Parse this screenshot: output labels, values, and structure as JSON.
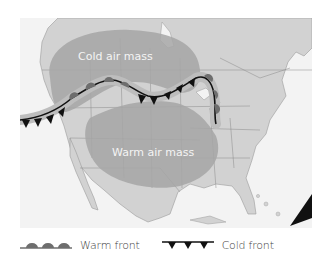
{
  "map": {
    "title": "",
    "air_masses": [
      {
        "label": "Cold air mass",
        "type": "cold"
      },
      {
        "label": "Warm air mass",
        "type": "warm"
      }
    ],
    "fronts": [
      {
        "type": "warm front",
        "symbol": "semicircles"
      },
      {
        "type": "cold front",
        "symbol": "triangles"
      }
    ],
    "colors": {
      "background": "#f3f3f3",
      "land": "#d2d2d2",
      "air_mass": "#a6a6a6",
      "air_mass_halo": "#bdbdbd",
      "front_warm": "#6e6e6e",
      "front_cold": "#111111",
      "borders": "#8a8a8a"
    }
  },
  "legend": {
    "warm_label": "Warm front",
    "cold_label": "Cold front"
  }
}
